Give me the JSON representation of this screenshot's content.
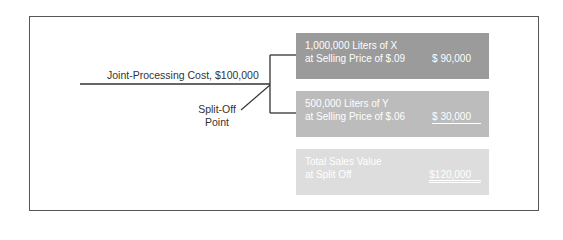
{
  "diagram": {
    "type": "joint-cost split-off diagram",
    "joint_cost_label": "Joint-Processing Cost, $100,000",
    "split_off_label": [
      "Split-Off",
      "Point"
    ],
    "colors": {
      "frame": "#555555",
      "line": "#333333",
      "box_x": "#9b9b9b",
      "box_y": "#bcbcbc",
      "box_total": "#dddddd",
      "box_text": "#ffffff"
    },
    "products": [
      {
        "line1": "1,000,000 Liters of X",
        "line2": "at Selling Price of $.09",
        "amount": "$ 90,000"
      },
      {
        "line1": "500,000 Liters of Y",
        "line2": "at Selling Price of $.06",
        "amount": "$ 30,000"
      }
    ],
    "total": {
      "line1": "Total Sales Value",
      "line2": "at Split Off",
      "amount": "$120,000"
    }
  }
}
